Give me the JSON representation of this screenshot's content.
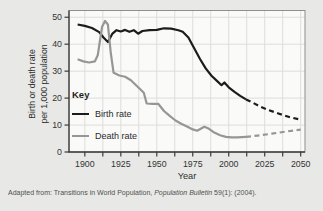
{
  "figure": {
    "background": "#e8e9e6",
    "caption": {
      "prefix": "Adapted from: Transitions in World Population, ",
      "italic": "Population Bulletin",
      "suffix": " 59(1): (2004)."
    }
  },
  "chart_data": {
    "type": "line",
    "title": "",
    "xlabel": "Year",
    "ylabel_line1": "Birth or death rate",
    "ylabel_line2": "per 1,000 population",
    "xlim": [
      1889,
      2053
    ],
    "ylim": [
      0,
      52.5
    ],
    "x_ticks_major": [
      1900,
      1925,
      1950,
      1975,
      2000,
      2025,
      2050
    ],
    "x_grid_start": 1900,
    "x_grid_end": 2050,
    "x_minor_step": 12.5,
    "y_ticks": [
      0,
      10,
      20,
      30,
      40,
      50
    ],
    "grid": true,
    "legend_position": "inside-left",
    "legend": {
      "title": "Key",
      "entries": [
        {
          "label": "Birth rate",
          "color": "#1c1c1c"
        },
        {
          "label": "Death rate",
          "color": "#969696"
        }
      ]
    },
    "colors": {
      "plot_bg": "#fafaf8",
      "grid": "#dedddb",
      "box": "#8f8f8f",
      "axis": "#3c3c3c",
      "tick_text": "#333333"
    },
    "note": "dashed segments are projections after ~2012",
    "series": [
      {
        "name": "Birth rate",
        "color": "#1c1c1c",
        "solid": [
          [
            1895,
            47.3
          ],
          [
            1900,
            46.8
          ],
          [
            1905,
            46.0
          ],
          [
            1910,
            44.5
          ],
          [
            1913,
            42.5
          ],
          [
            1916,
            40.8
          ],
          [
            1919,
            43.8
          ],
          [
            1922,
            45.2
          ],
          [
            1925,
            44.7
          ],
          [
            1928,
            45.3
          ],
          [
            1931,
            44.6
          ],
          [
            1934,
            45.2
          ],
          [
            1937,
            43.9
          ],
          [
            1940,
            44.9
          ],
          [
            1945,
            45.2
          ],
          [
            1950,
            45.3
          ],
          [
            1955,
            45.9
          ],
          [
            1960,
            45.8
          ],
          [
            1965,
            45.2
          ],
          [
            1968,
            44.6
          ],
          [
            1972,
            42.5
          ],
          [
            1976,
            38.5
          ],
          [
            1980,
            34.5
          ],
          [
            1984,
            31.0
          ],
          [
            1988,
            28.3
          ],
          [
            1992,
            26.3
          ],
          [
            1995,
            24.8
          ],
          [
            1997,
            25.8
          ],
          [
            2000,
            24.0
          ],
          [
            2004,
            22.3
          ],
          [
            2008,
            20.8
          ],
          [
            2012,
            19.5
          ]
        ],
        "dashed": [
          [
            2012,
            19.5
          ],
          [
            2017,
            18.2
          ],
          [
            2022,
            16.8
          ],
          [
            2028,
            15.5
          ],
          [
            2035,
            14.2
          ],
          [
            2042,
            13.0
          ],
          [
            2050,
            12.0
          ]
        ]
      },
      {
        "name": "Death rate",
        "color": "#969696",
        "solid": [
          [
            1895,
            34.4
          ],
          [
            1899,
            33.6
          ],
          [
            1903,
            33.2
          ],
          [
            1907,
            33.6
          ],
          [
            1909,
            36.0
          ],
          [
            1912,
            46.5
          ],
          [
            1914,
            48.6
          ],
          [
            1916,
            47.3
          ],
          [
            1918,
            37.0
          ],
          [
            1920,
            29.4
          ],
          [
            1924,
            28.4
          ],
          [
            1928,
            27.9
          ],
          [
            1932,
            26.6
          ],
          [
            1936,
            24.6
          ],
          [
            1939,
            23.0
          ],
          [
            1941,
            22.0
          ],
          [
            1943,
            18.0
          ],
          [
            1947,
            17.9
          ],
          [
            1951,
            17.9
          ],
          [
            1955,
            15.2
          ],
          [
            1959,
            13.4
          ],
          [
            1963,
            11.7
          ],
          [
            1967,
            10.5
          ],
          [
            1971,
            9.5
          ],
          [
            1975,
            8.4
          ],
          [
            1978,
            7.9
          ],
          [
            1983,
            9.4
          ],
          [
            1986,
            8.7
          ],
          [
            1990,
            7.2
          ],
          [
            1994,
            6.2
          ],
          [
            1998,
            5.6
          ],
          [
            2002,
            5.4
          ],
          [
            2006,
            5.4
          ],
          [
            2012,
            5.6
          ]
        ],
        "dashed": [
          [
            2012,
            5.6
          ],
          [
            2020,
            6.1
          ],
          [
            2030,
            6.8
          ],
          [
            2040,
            7.6
          ],
          [
            2050,
            8.3
          ]
        ]
      }
    ]
  }
}
